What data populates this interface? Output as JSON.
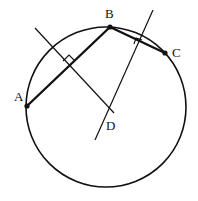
{
  "diagram": {
    "type": "geometry",
    "stroke_color": "#111111",
    "background": "#ffffff",
    "circle": {
      "cx": 106,
      "cy": 107,
      "r": 80
    },
    "points": [
      {
        "id": "A",
        "label": "A",
        "x": 27,
        "y": 106,
        "label_x": 14,
        "label_y": 101
      },
      {
        "id": "B",
        "label": "B",
        "x": 110,
        "y": 27,
        "label_x": 105,
        "label_y": 18
      },
      {
        "id": "C",
        "label": "C",
        "x": 165,
        "y": 53,
        "label_x": 172,
        "label_y": 57
      },
      {
        "id": "D",
        "label": "D",
        "x": 108,
        "y": 110,
        "label_x": 106,
        "label_y": 130
      }
    ],
    "chords": [
      {
        "from": "A",
        "to": "B"
      },
      {
        "from": "B",
        "to": "C"
      }
    ],
    "bisector_lines": [
      {
        "name": "perp-bisector-AB",
        "x1": 35,
        "y1": 28,
        "x2": 114,
        "y2": 113
      },
      {
        "name": "perp-bisector-BC",
        "x1": 153,
        "y1": 10,
        "x2": 95,
        "y2": 140
      }
    ],
    "right_angle_marks": [
      {
        "name": "right-angle-AB",
        "points": "63,61 69,55 75,61 69,67"
      },
      {
        "name": "right-angle-BC",
        "points": "134,44 136,38 142,40 140,46"
      }
    ]
  }
}
